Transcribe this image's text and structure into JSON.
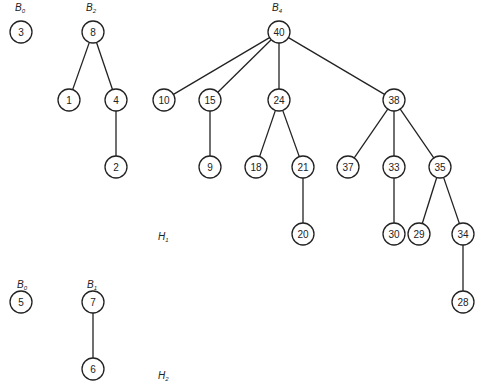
{
  "heaps": [
    {
      "id": "H1",
      "label": {
        "main": "H",
        "sub": "1",
        "x": 158,
        "y": 232
      },
      "trees": [
        {
          "id": "H1-B0",
          "label": {
            "main": "B",
            "sub": "0",
            "x": 15,
            "y": 3
          },
          "root": "3"
        },
        {
          "id": "H1-B2",
          "label": {
            "main": "B",
            "sub": "2",
            "x": 86,
            "y": 3
          },
          "root": "8"
        },
        {
          "id": "H1-B4",
          "label": {
            "main": "B",
            "sub": "4",
            "x": 272,
            "y": 3
          },
          "root": "40"
        }
      ]
    },
    {
      "id": "H2",
      "label": {
        "main": "H",
        "sub": "2",
        "x": 158,
        "y": 371
      },
      "trees": [
        {
          "id": "H2-B0",
          "label": {
            "main": "B",
            "sub": "0",
            "x": 17,
            "y": 280
          },
          "root": "5"
        },
        {
          "id": "H2-B1",
          "label": {
            "main": "B",
            "sub": "1",
            "x": 87,
            "y": 280
          },
          "root": "7"
        }
      ]
    }
  ],
  "nodes": [
    {
      "key": "3",
      "x": 21,
      "y": 32
    },
    {
      "key": "8",
      "x": 93,
      "y": 32
    },
    {
      "key": "1",
      "x": 69,
      "y": 100
    },
    {
      "key": "4",
      "x": 116,
      "y": 100
    },
    {
      "key": "2",
      "x": 116,
      "y": 167
    },
    {
      "key": "40",
      "x": 279,
      "y": 32
    },
    {
      "key": "10",
      "x": 164,
      "y": 100
    },
    {
      "key": "15",
      "x": 210,
      "y": 100
    },
    {
      "key": "24",
      "x": 279,
      "y": 100
    },
    {
      "key": "38",
      "x": 394,
      "y": 100
    },
    {
      "key": "9",
      "x": 210,
      "y": 167
    },
    {
      "key": "18",
      "x": 256,
      "y": 167
    },
    {
      "key": "21",
      "x": 303,
      "y": 167
    },
    {
      "key": "20",
      "x": 303,
      "y": 234
    },
    {
      "key": "37",
      "x": 348,
      "y": 167
    },
    {
      "key": "33",
      "x": 394,
      "y": 167
    },
    {
      "key": "35",
      "x": 440,
      "y": 167
    },
    {
      "key": "30",
      "x": 394,
      "y": 234
    },
    {
      "key": "29",
      "x": 419,
      "y": 234
    },
    {
      "key": "34",
      "x": 463,
      "y": 234
    },
    {
      "key": "28",
      "x": 463,
      "y": 302
    },
    {
      "key": "5",
      "x": 21,
      "y": 302
    },
    {
      "key": "7",
      "x": 93,
      "y": 302
    },
    {
      "key": "6",
      "x": 93,
      "y": 369
    }
  ],
  "edges": [
    [
      "8",
      "1"
    ],
    [
      "8",
      "4"
    ],
    [
      "4",
      "2"
    ],
    [
      "40",
      "10"
    ],
    [
      "40",
      "15"
    ],
    [
      "40",
      "24"
    ],
    [
      "40",
      "38"
    ],
    [
      "15",
      "9"
    ],
    [
      "24",
      "18"
    ],
    [
      "24",
      "21"
    ],
    [
      "21",
      "20"
    ],
    [
      "38",
      "37"
    ],
    [
      "38",
      "33"
    ],
    [
      "38",
      "35"
    ],
    [
      "33",
      "30"
    ],
    [
      "35",
      "29"
    ],
    [
      "35",
      "34"
    ],
    [
      "34",
      "28"
    ],
    [
      "7",
      "6"
    ]
  ],
  "style": {
    "node_radius": 11,
    "stroke": "#222222",
    "fill": "#ffffff",
    "background": "#ffffff"
  }
}
